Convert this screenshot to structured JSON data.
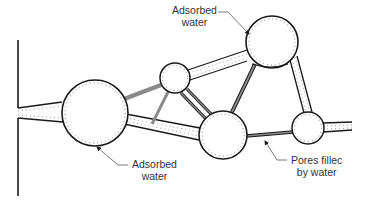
{
  "diagram": {
    "colors": {
      "outline": "#1a1a1a",
      "filled_pore": "#8a8a8a",
      "dots": "#777777",
      "leader": "#555555",
      "text": "#333333"
    },
    "labels": [
      {
        "id": "adsorbed-top",
        "line1": "Adsorbed",
        "line2": "water"
      },
      {
        "id": "adsorbed-bottom",
        "line1": "Adsorbed",
        "line2": "water"
      },
      {
        "id": "pores-filled",
        "line1": "Pores fillec",
        "line2": "by water"
      }
    ],
    "legend_concepts": [
      "Adsorbed water (dotted lining)",
      "Pores filled by water (shaded throats)"
    ]
  }
}
